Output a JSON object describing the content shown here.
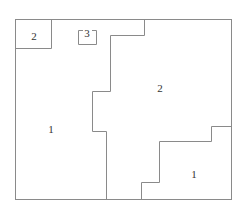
{
  "diagram": {
    "type": "region-partition",
    "stroke_color": "#8a8a8a",
    "labels": [
      {
        "id": "region-top-left-box",
        "text": "2",
        "x": 34,
        "y": 40
      },
      {
        "id": "region-small-box",
        "text": "3",
        "x": 87,
        "y": 36
      },
      {
        "id": "region-left",
        "text": "1",
        "x": 51,
        "y": 132
      },
      {
        "id": "region-center-right",
        "text": "2",
        "x": 160,
        "y": 91
      },
      {
        "id": "region-bottom-right",
        "text": "1",
        "x": 194,
        "y": 177
      }
    ]
  }
}
